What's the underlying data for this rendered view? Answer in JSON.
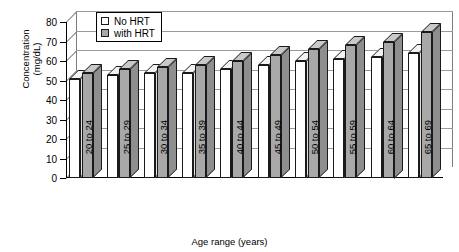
{
  "chart_data": {
    "type": "bar",
    "title": "",
    "xlabel": "Age range (years)",
    "ylabel_line1": "Concentration",
    "ylabel_line2": "(mg/dL)",
    "ylim": [
      0,
      80
    ],
    "ytick_step": 10,
    "yticks": [
      "80",
      "70",
      "60",
      "50",
      "40",
      "30",
      "20",
      "10",
      "0"
    ],
    "grid": true,
    "legend_position": "top-left-inside",
    "categories": [
      "20 to 24",
      "25 to 29",
      "30 to 34",
      "35 to 39",
      "40 to 44",
      "45 to 49",
      "50 to 54",
      "55 to 59",
      "60 to 64",
      "65 to 69"
    ],
    "series": [
      {
        "name": "No HRT",
        "color": "#ffffff",
        "values": [
          51,
          53,
          54,
          54,
          56,
          58,
          60,
          61,
          62,
          64
        ]
      },
      {
        "name": "with HRT",
        "color": "#a8a8a8",
        "values": [
          54,
          56,
          57,
          58,
          60,
          63,
          66,
          68,
          70,
          75
        ]
      }
    ]
  },
  "legend": {
    "items": [
      {
        "label": "No HRT",
        "swatch": "legend-swatch-no-hrt"
      },
      {
        "label": "with HRT",
        "swatch": "legend-swatch-with-hrt"
      }
    ]
  }
}
